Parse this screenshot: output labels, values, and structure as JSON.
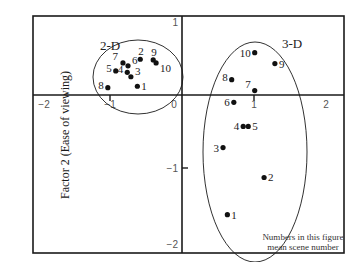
{
  "chart_data": {
    "type": "scatter",
    "title": "",
    "xlabel": "",
    "ylabel": "Factor 2 (Ease of viewing)",
    "xlim": [
      -2.05,
      2.25
    ],
    "ylim": [
      -2.15,
      1.1
    ],
    "x_ticks": [
      {
        "value": -2,
        "label": "-2"
      },
      {
        "value": -1,
        "label": "-1"
      },
      {
        "value": 0,
        "label": "0"
      },
      {
        "value": 1,
        "label": "1"
      },
      {
        "value": 2,
        "label": "2"
      }
    ],
    "y_ticks": [
      {
        "value": 1,
        "label": "1"
      },
      {
        "value": -1,
        "label": "-1"
      },
      {
        "value": -2,
        "label": "-2"
      }
    ],
    "grid": false,
    "series": [
      {
        "name": "2-D",
        "points": [
          {
            "label": "1",
            "x": -0.62,
            "y": 0.12
          },
          {
            "label": "2",
            "x": -0.58,
            "y": 0.49
          },
          {
            "label": "3",
            "x": -0.71,
            "y": 0.25
          },
          {
            "label": "4",
            "x": -0.76,
            "y": 0.31
          },
          {
            "label": "5",
            "x": -0.92,
            "y": 0.33
          },
          {
            "label": "6",
            "x": -0.75,
            "y": 0.4
          },
          {
            "label": "7",
            "x": -0.82,
            "y": 0.44
          },
          {
            "label": "8",
            "x": -1.03,
            "y": 0.1
          },
          {
            "label": "9",
            "x": -0.4,
            "y": 0.48
          },
          {
            "label": "10",
            "x": -0.36,
            "y": 0.44
          }
        ]
      },
      {
        "name": "3-D",
        "points": [
          {
            "label": "1",
            "x": 0.63,
            "y": -1.64
          },
          {
            "label": "2",
            "x": 1.14,
            "y": -1.13
          },
          {
            "label": "3",
            "x": 0.57,
            "y": -0.72
          },
          {
            "label": "4",
            "x": 0.85,
            "y": -0.43
          },
          {
            "label": "5",
            "x": 0.92,
            "y": -0.43
          },
          {
            "label": "6",
            "x": 0.72,
            "y": -0.1
          },
          {
            "label": "7",
            "x": 1.01,
            "y": 0.06
          },
          {
            "label": "8",
            "x": 0.69,
            "y": 0.21
          },
          {
            "label": "9",
            "x": 1.29,
            "y": 0.43
          },
          {
            "label": "10",
            "x": 1.01,
            "y": 0.58
          }
        ]
      }
    ],
    "annotations": [
      {
        "text": "2-D",
        "x": -1.18,
        "y": 0.63
      },
      {
        "text": "3-D",
        "x": 1.35,
        "y": 0.73
      },
      {
        "text": "Numbers in this figure",
        "x": 1.88,
        "y": -1.88
      },
      {
        "text": "mean scene number",
        "x": 1.88,
        "y": -2.0
      }
    ],
    "legend": null
  },
  "labels": {
    "ylabel": "Factor 2 (Ease of viewing)",
    "group_2d": "2-D",
    "group_3d": "3-D",
    "note_line1": "Numbers in this figure",
    "note_line2": "mean scene number"
  }
}
